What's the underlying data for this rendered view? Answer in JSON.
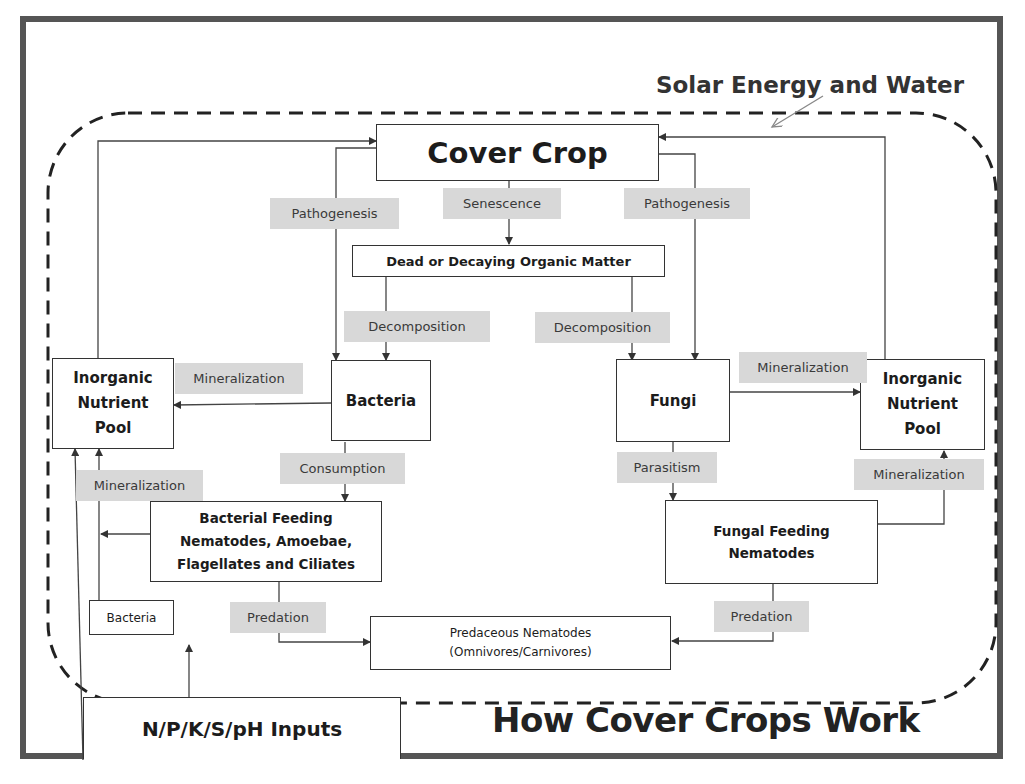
{
  "diagram": {
    "title": "How Cover Crops Work",
    "boundary_label": "Solar Energy and Water",
    "nodes": {
      "cover_crop": "Cover Crop",
      "dead_matter": "Dead or Decaying Organic Matter",
      "bacteria": "Bacteria",
      "fungi": "Fungi",
      "pool_left": "Inorganic Nutrient Pool",
      "pool_right": "Inorganic Nutrient Pool",
      "bacterial_feeders": "Bacterial Feeding Nematodes, Amoebae, Flagellates and Ciliates",
      "fungal_feeders": "Fungal Feeding Nematodes",
      "predaceous": "Predaceous Nematodes",
      "predaceous_sub": "(Omnivores/Carnivores)",
      "bacteria_small": "Bacteria",
      "inputs": "N/P/K/S/pH Inputs"
    },
    "edge_labels": {
      "pathogenesis_left": "Pathogenesis",
      "senescence": "Senescence",
      "pathogenesis_right": "Pathogenesis",
      "decomposition_left": "Decomposition",
      "decomposition_right": "Decomposition",
      "mineralization_bacteria": "Mineralization",
      "mineralization_fungi": "Mineralization",
      "consumption": "Consumption",
      "parasitism": "Parasitism",
      "mineralization_left_low": "Mineralization",
      "mineralization_right_low": "Mineralization",
      "predation_left": "Predation",
      "predation_right": "Predation"
    },
    "pool_lines": {
      "left": [
        "Inorganic",
        "Nutrient",
        "Pool"
      ],
      "right": [
        "Inorganic",
        "Nutrient",
        "Pool"
      ]
    },
    "bacterial_feeder_lines": [
      "Bacterial Feeding",
      "Nematodes, Amoebae,",
      "Flagellates and Ciliates"
    ],
    "fungal_feeder_lines": [
      "Fungal Feeding",
      "Nematodes"
    ],
    "colors": {
      "frame": "#555555",
      "label_bg": "#d8d8d8",
      "line": "#333333"
    }
  }
}
